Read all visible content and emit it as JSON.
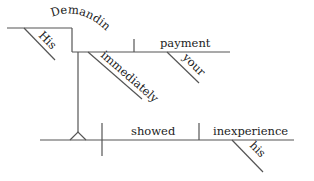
{
  "diagram": {
    "type": "sentence-diagram",
    "words": {
      "gerund": "Demanding",
      "gerund_modifier": "His",
      "adverb": "immediately",
      "gerund_object": "payment",
      "object_modifier": "your",
      "verb": "showed",
      "object": "inexperience",
      "object_modifier_2": "his"
    },
    "line_color": "#555555",
    "text_color": "#222222"
  }
}
